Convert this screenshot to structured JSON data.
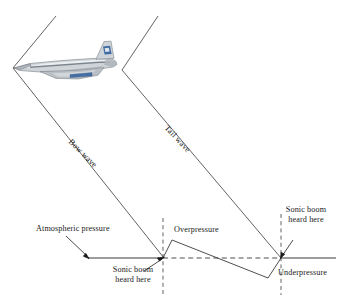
{
  "figure": {
    "aircraft": {
      "name": "supersonic-airliner",
      "description": "Concorde-style delta wing airliner flying to the left",
      "body_color": "#c9cdd2",
      "highlight_color": "#eef1f4",
      "accent_color": "#2f5f9e",
      "outline_color": "#6b7278"
    },
    "line_color": "#3a3a3a",
    "text_color": "#1a1a1a",
    "labels": {
      "bow_wave": "Bow wave",
      "tail_wave": "Tail wave",
      "atmospheric_pressure": "Atmospheric pressure",
      "overpressure": "Overpressure",
      "underpressure": "Underpressure",
      "sonic_boom_left_line1": "Sonic boom",
      "sonic_boom_left_line2": "heard here",
      "sonic_boom_right_line1": "Sonic boom",
      "sonic_boom_right_line2": "heard here"
    }
  }
}
